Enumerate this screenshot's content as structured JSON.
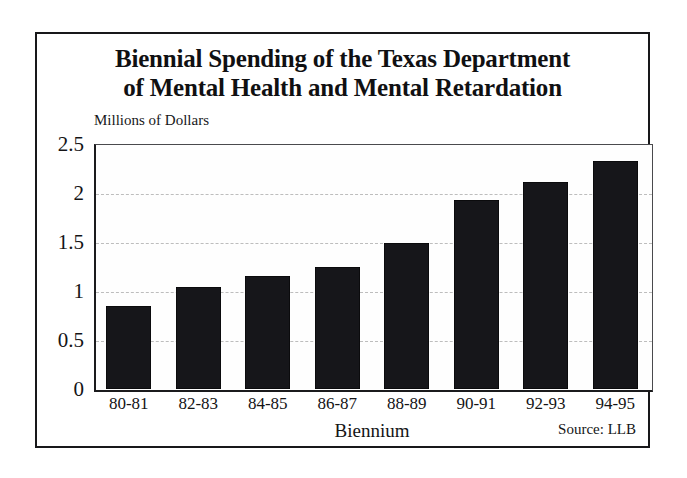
{
  "figure": {
    "title_line_1": "Biennial Spending of the Texas Department",
    "title_line_2": "of Mental Health and Mental Retardation",
    "source_note": "Source:  LLB",
    "frame_color": "#18181a",
    "background_color": "#ffffff"
  },
  "chart_data": {
    "type": "bar",
    "title": "Biennial Spending of the Texas Department of Mental Health and Mental Retardation",
    "subtitle": "",
    "categories": [
      "80-81",
      "82-83",
      "84-85",
      "86-87",
      "88-89",
      "90-91",
      "92-93",
      "94-95"
    ],
    "values": [
      0.85,
      1.04,
      1.15,
      1.25,
      1.49,
      1.93,
      2.11,
      2.33
    ],
    "xlabel": "Biennium",
    "ylabel": "Millions of Dollars",
    "ylim": [
      0,
      2.5
    ],
    "yticks": [
      0,
      0.5,
      1,
      1.5,
      2,
      2.5
    ],
    "ytick_labels": [
      "0",
      "0.5",
      "1",
      "1.5",
      "2",
      "2.5"
    ],
    "gridlines": true,
    "gridline_style": "dashed",
    "gridline_color": "#bdbdbd",
    "bar_color": "#16161a",
    "legend": "none",
    "annotations": [
      "Source:  LLB"
    ]
  }
}
